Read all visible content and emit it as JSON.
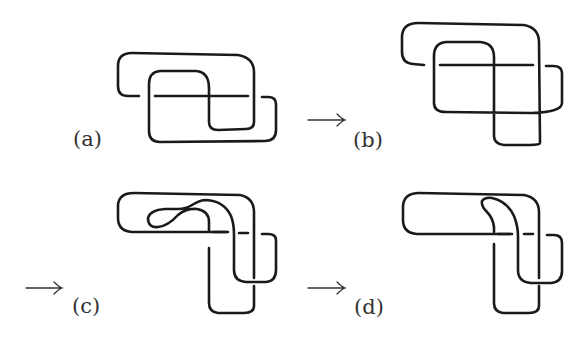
{
  "figure": {
    "panels": [
      {
        "id": "a",
        "label": "(a)",
        "arrow_before": false
      },
      {
        "id": "b",
        "label": "(b)",
        "arrow_before": true
      },
      {
        "id": "c",
        "label": "(c)",
        "arrow_before": true
      },
      {
        "id": "d",
        "label": "(d)",
        "arrow_before": true
      }
    ],
    "arrow_glyph": "→",
    "colors": {
      "stroke": "#1a1a1a",
      "label": "#333333",
      "background": "#ffffff"
    }
  }
}
